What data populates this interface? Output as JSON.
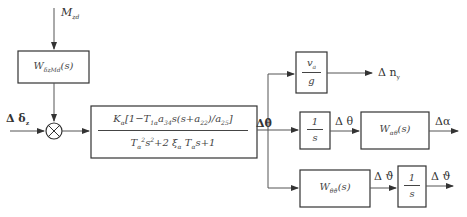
{
  "diagram": {
    "type": "control block diagram",
    "inputs": {
      "disturbance": "M_zd",
      "control": "Δδ_z"
    },
    "blocks": {
      "disturbance_tf": {
        "label": "W_{δzd}(s)",
        "main": "W",
        "sub": "δzMd",
        "arg": "(s)"
      },
      "summing_junction": {
        "symbol": "⊗"
      },
      "main_tf": {
        "numerator": "K_α[1 − T_1α a_34 s(s+a_22)/a_25]",
        "denominator": "T_α²s² + 2 ξ_α T_α s + 1"
      },
      "gain_block": {
        "numerator": "v_a",
        "denominator": "g"
      },
      "integrator_1": {
        "numerator": "1",
        "denominator": "s"
      },
      "alpha_tf": {
        "main": "W",
        "sub": "αθ",
        "arg": "(s)"
      },
      "theta_dot_tf": {
        "main": "W",
        "sub": "θ̇ϑ̇",
        "arg": "(s)"
      },
      "integrator_2": {
        "numerator": "1",
        "denominator": "s"
      }
    },
    "signals": {
      "theta_dot": "Δθ̇",
      "normal_load": "Δn_y",
      "theta": "Δθ",
      "alpha": "Δα",
      "pitch_rate": "Δϑ̇",
      "pitch": "Δϑ"
    }
  },
  "labels": {
    "m_main": "M",
    "m_sub": "zd",
    "delta_main": "Δ δ",
    "delta_sub": "z",
    "theta_dot_main": "Δθ̇",
    "ny_main": "Δ n",
    "ny_sub": "y",
    "theta": "Δ θ",
    "alpha": "Δα",
    "pitch_rate": "Δ ϑ̇",
    "pitch": "Δ ϑ",
    "w_dist_main": "W",
    "w_dist_sub": "δzMd",
    "w_dist_arg": "(s)",
    "big_num_k": "K",
    "big_num_k_sub": "α",
    "big_num_rest_a": "[1−T",
    "big_num_t_sub": "1α",
    "big_num_a": "a",
    "big_num_a_sub": "34",
    "big_num_mid": "s(s+a",
    "big_num_a2_sub": "22",
    "big_num_end": ")/a",
    "big_num_a3_sub": "25",
    "big_num_close": "]",
    "big_den_t": "T",
    "big_den_t_sub": "α",
    "big_den_sq": "2",
    "big_den_s": "s",
    "big_den_s_sq": "2",
    "big_den_mid": "+2 ξ",
    "big_den_xi_sub": "α",
    "big_den_t2": "T",
    "big_den_t2_sub": "α",
    "big_den_end": "s+1",
    "va_main": "v",
    "va_sub": "a",
    "g": "g",
    "one": "1",
    "s": "s",
    "w_alpha_main": "W",
    "w_alpha_sub": "αθ",
    "w_alpha_arg": "(s)",
    "w_theta_main": "W",
    "w_theta_sub": "θ̇ϑ̇",
    "w_theta_arg": "(s)"
  }
}
